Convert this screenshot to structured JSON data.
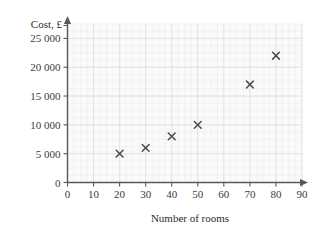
{
  "chart_data": {
    "type": "scatter",
    "title": "",
    "xlabel": "Number of rooms",
    "ylabel": "Cost, £",
    "xlim": [
      0,
      90
    ],
    "ylim": [
      0,
      27500
    ],
    "grid": true,
    "legend": "none",
    "x_ticks": [
      "0",
      "10",
      "20",
      "30",
      "40",
      "50",
      "60",
      "70",
      "80",
      "90"
    ],
    "x_tick_values": [
      0,
      10,
      20,
      30,
      40,
      50,
      60,
      70,
      80,
      90
    ],
    "y_ticks": [
      "0",
      "5 000",
      "10 000",
      "15 000",
      "20 000",
      "25 000"
    ],
    "y_tick_values": [
      0,
      5000,
      10000,
      15000,
      20000,
      25000
    ],
    "x": [
      20,
      30,
      40,
      50,
      70,
      80
    ],
    "y": [
      5000,
      6000,
      8000,
      10000,
      17000,
      22000
    ],
    "points": [
      {
        "x": 20,
        "y": 5000
      },
      {
        "x": 30,
        "y": 6000
      },
      {
        "x": 40,
        "y": 8000
      },
      {
        "x": 50,
        "y": 10000
      },
      {
        "x": 70,
        "y": 17000
      },
      {
        "x": 80,
        "y": 22000
      }
    ],
    "marker": "x",
    "marker_color": "#4a4a4c",
    "minor_grid_divisions": 4
  },
  "axes": {
    "y_axis_title": "Cost, £",
    "x_axis_title": "Number of rooms"
  },
  "colors": {
    "plot_background": "#fafafb",
    "grid_major": "#e0e0e2",
    "grid_minor": "#ececed",
    "axis": "#58585a",
    "text": "#3a3a3a",
    "marker": "#4a4a4c"
  }
}
